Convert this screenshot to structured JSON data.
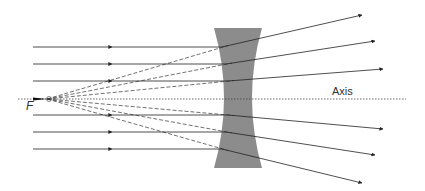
{
  "diagram": {
    "labels": {
      "focal_point": "F",
      "axis": "Axis"
    },
    "colors": {
      "lens": "#8c8c8c",
      "ray": "#222222",
      "dashed_extension": "#333333",
      "axis": "#444444",
      "background": "#ffffff"
    },
    "focal_point": {
      "x": 47,
      "y": 99
    },
    "axis": {
      "y": 99,
      "x_start": 18,
      "x_end": 406
    },
    "lens": {
      "top_y": 28,
      "bottom_y": 168,
      "outer_left_x": 214,
      "outer_right_x": 262,
      "waist_left_x": 228,
      "waist_right_x": 248
    },
    "rays": [
      {
        "incoming_y": 47,
        "refract_x": 222,
        "end": [
          362,
          15
        ]
      },
      {
        "incoming_y": 64,
        "refract_x": 226,
        "end": [
          375,
          41
        ]
      },
      {
        "incoming_y": 81,
        "refract_x": 228,
        "end": [
          383,
          69
        ]
      },
      {
        "incoming_y": 115,
        "refract_x": 228,
        "end": [
          383,
          129
        ]
      },
      {
        "incoming_y": 132,
        "refract_x": 226,
        "end": [
          375,
          155
        ]
      },
      {
        "incoming_y": 149,
        "refract_x": 222,
        "end": [
          362,
          183
        ]
      }
    ],
    "incoming_start_x": 33,
    "incoming_arrow_x": 112
  }
}
